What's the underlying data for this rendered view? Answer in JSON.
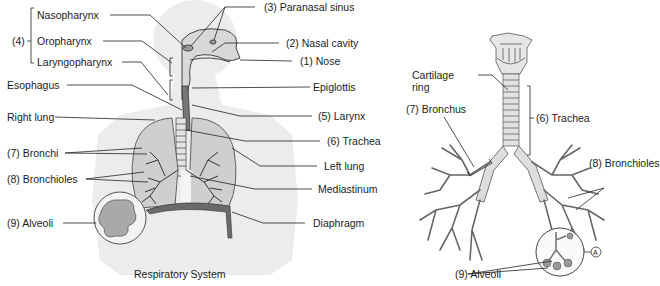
{
  "left_diagram": {
    "caption": "Respiratory System",
    "group_label": "(4)",
    "labels": {
      "nasopharynx": "Nasopharynx",
      "oropharynx": "Oropharynx",
      "laryngopharynx": "Laryngopharynx",
      "esophagus": "Esophagus",
      "right_lung": "Right lung",
      "bronchi": "(7) Bronchi",
      "bronchioles": "(8) Bronchioles",
      "alveoli": "(9) Alveoli",
      "paranasal_sinus": "(3) Paranasal sinus",
      "nasal_cavity": "(2) Nasal cavity",
      "nose": "(1) Nose",
      "epiglottis": "Epiglottis",
      "larynx": "(5) Larynx",
      "trachea": "(6) Trachea",
      "left_lung": "Left lung",
      "mediastinum": "Mediastinum",
      "diaphragm": "Diaphragm"
    }
  },
  "right_diagram": {
    "labels": {
      "cartilage_ring_1": "Cartilage",
      "cartilage_ring_2": "ring",
      "bronchus": "(7) Bronchus",
      "trachea": "(6) Trachea",
      "bronchioles": "(8) Bronchioles",
      "alveoli": "(9) Alveoli",
      "marker": "A"
    }
  },
  "colors": {
    "body_silhouette": "#ededed",
    "lung_fill": "#cfcfcf",
    "diaphragm": "#6a6a6a",
    "line": "#333333",
    "airway_fill": "#dcdcdc"
  }
}
